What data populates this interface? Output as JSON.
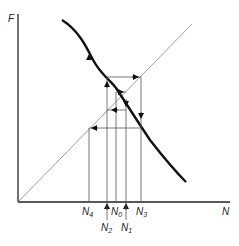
{
  "diagram": {
    "type": "cobweb-plot",
    "y_axis_label": "F",
    "x_axis_label": "N",
    "curve": "decreasing recruitment curve F(N)",
    "diagonal": "replacement line F = N",
    "colors": {
      "axes": "#222222",
      "curve": "#111111",
      "thin": "#555555",
      "diagonal": "#888888"
    },
    "x_ticks": [
      {
        "name": "N",
        "sub": "4",
        "position": "above"
      },
      {
        "name": "N",
        "sub": "0",
        "position": "above"
      },
      {
        "name": "N",
        "sub": "3",
        "position": "above"
      },
      {
        "name": "N",
        "sub": "2",
        "position": "below"
      },
      {
        "name": "N",
        "sub": "1",
        "position": "below"
      }
    ]
  }
}
